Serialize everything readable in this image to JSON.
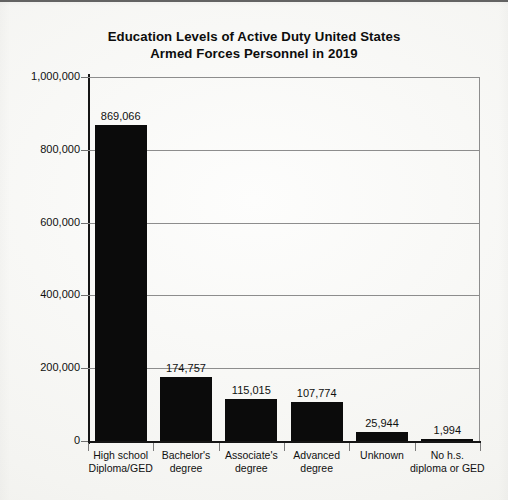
{
  "chart_data": {
    "type": "bar",
    "title": "Education Levels of Active Duty United States Armed Forces Personnel in 2019",
    "title_lines": [
      "Education Levels of Active Duty United States",
      "Armed Forces Personnel in 2019"
    ],
    "xlabel": "",
    "ylabel": "",
    "ylim": [
      0,
      1000000
    ],
    "grid": true,
    "legend": false,
    "categories": [
      "High school Diploma/GED",
      "Bachelor's degree",
      "Associate's degree",
      "Advanced degree",
      "Unknown",
      "No h.s. diploma or GED"
    ],
    "category_label_lines": [
      [
        "High school",
        "Diploma/GED"
      ],
      [
        "Bachelor's",
        "degree"
      ],
      [
        "Associate's",
        "degree"
      ],
      [
        "Advanced",
        "degree"
      ],
      [
        "Unknown"
      ],
      [
        "No h.s.",
        "diploma or GED"
      ]
    ],
    "values": [
      869066,
      174757,
      115015,
      107774,
      25944,
      1994
    ],
    "value_labels": [
      "869,066",
      "174,757",
      "115,015",
      "107,774",
      "25,944",
      "1,994"
    ],
    "ytick_values": [
      1000000,
      800000,
      600000,
      400000,
      200000,
      0
    ],
    "ytick_labels": [
      "1,000,000",
      "800,000",
      "600,000",
      "400,000",
      "200,000",
      "0"
    ],
    "bar_color": "#0b0b0b",
    "axis_color": "#151515",
    "grid_color": "#8d8d8d",
    "background_color": "#f6f6f4"
  }
}
